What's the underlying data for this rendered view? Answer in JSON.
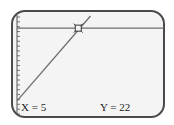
{
  "calculator": {
    "screen": "graph",
    "trace": {
      "x_label": "X = 5",
      "y_label": "Y = 22",
      "x": 5,
      "y": 22
    },
    "colors": {
      "line": "#6e6e6e",
      "border": "#4a4a4a",
      "background": "#f4f4f4"
    }
  },
  "chart_data": {
    "type": "line",
    "title": "",
    "xlabel": "",
    "ylabel": "",
    "y_axis_ticks": 20,
    "series": [
      {
        "name": "horizontal-line",
        "equation": "Y = 22",
        "x": [
          0,
          12
        ],
        "y": [
          22,
          22
        ]
      },
      {
        "name": "diagonal-line",
        "x": [
          0,
          6
        ],
        "y": [
          4,
          25
        ]
      }
    ],
    "intersection": {
      "x": 5,
      "y": 22
    },
    "xlim": [
      0,
      12
    ],
    "ylim": [
      0,
      26
    ],
    "grid": false
  }
}
